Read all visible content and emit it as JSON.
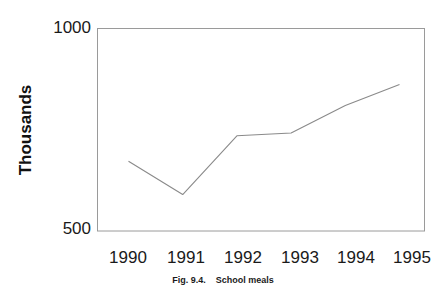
{
  "figure": {
    "caption_label": "Fig. 9.4.",
    "caption_title": "School meals",
    "caption_full": "Fig. 9.4.    School meals"
  },
  "chart_data": {
    "type": "line",
    "title": "",
    "subtitle": "",
    "xlabel": "",
    "ylabel": "Thousands",
    "categories": [
      "1990",
      "1991",
      "1992",
      "1993",
      "1994",
      "1995"
    ],
    "x": [
      1990,
      1991,
      1992,
      1993,
      1994,
      1995
    ],
    "values": [
      672,
      590,
      735,
      742,
      810,
      862
    ],
    "series": [
      {
        "name": "School meals",
        "values": [
          672,
          590,
          735,
          742,
          810,
          862
        ]
      }
    ],
    "ylim": [
      500,
      1000
    ],
    "ytick_labels": [
      "500",
      "1000"
    ],
    "ytick_values": [
      500,
      1000
    ],
    "xtick_labels": [
      "1990",
      "1991",
      "1992",
      "1993",
      "1994",
      "1995"
    ],
    "grid": false,
    "legend": "none",
    "line_color": "#8a8a8a",
    "frame_color": "#9a9a9a",
    "background_color": "#ffffff",
    "text_color": "#1a1a1a"
  }
}
